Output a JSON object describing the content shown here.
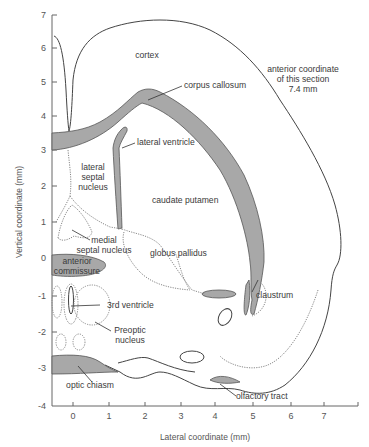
{
  "figure": {
    "section_note": [
      "anterior coordinate",
      "of this section",
      "7.4 mm"
    ],
    "x_axis": {
      "title": "Lateral coordinate (mm)",
      "ticks": [
        "0",
        "1",
        "2",
        "3",
        "4",
        "5",
        "6",
        "7"
      ]
    },
    "y_axis": {
      "title": "Vertical coordinate (mm)",
      "ticks": [
        "7",
        "6",
        "5",
        "4",
        "3",
        "2",
        "1",
        "0",
        "-1",
        "-2",
        "-3",
        "-4"
      ]
    },
    "labels": {
      "cortex": "cortex",
      "corpus_callosum": "corpus callosum",
      "lateral_ventricle": "lateral ventricle",
      "lateral_septal_nucleus": [
        "lateral",
        "septal",
        "nucleus"
      ],
      "caudate_putamen": "caudate putamen",
      "medial_septal_nucleus": [
        "medial",
        "septal nucleus"
      ],
      "globus_pallidus": "globus pallidus",
      "anterior_commissure": [
        "anterior",
        "commissure"
      ],
      "claustrum": "claustrum",
      "third_ventricle": "3rd ventricle",
      "preoptic_nucleus": [
        "Preoptic",
        "nucleus"
      ],
      "optic_chiasm": "optic chiasm",
      "olfactory_tract": "olfactory tract"
    },
    "colors": {
      "fiber_tract_fill": "#a8a8a8",
      "outline": "#444444",
      "text": "#3a3a3a"
    }
  }
}
